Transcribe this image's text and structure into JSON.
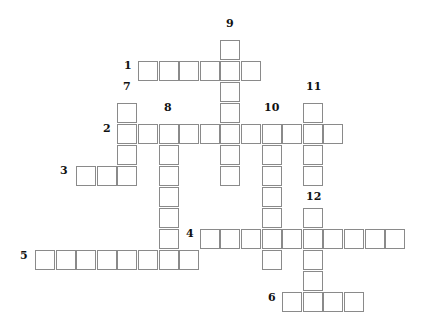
{
  "puzzle": {
    "type": "crossword",
    "grid_origin": {
      "x": 35,
      "y": 40
    },
    "cell_pitch": {
      "x": 20.6,
      "y": 21
    },
    "words": [
      {
        "number": "1",
        "direction": "across",
        "row": 1,
        "col": 5,
        "length": 6,
        "label_pos": {
          "x": 124,
          "y": 65
        }
      },
      {
        "number": "2",
        "direction": "across",
        "row": 4,
        "col": 4,
        "length": 11,
        "label_pos": {
          "x": 103,
          "y": 128
        }
      },
      {
        "number": "3",
        "direction": "across",
        "row": 6,
        "col": 2,
        "length": 3,
        "label_pos": {
          "x": 60,
          "y": 170
        }
      },
      {
        "number": "4",
        "direction": "across",
        "row": 9,
        "col": 8,
        "length": 10,
        "label_pos": {
          "x": 186,
          "y": 233
        }
      },
      {
        "number": "5",
        "direction": "across",
        "row": 10,
        "col": 0,
        "length": 8,
        "label_pos": {
          "x": 20,
          "y": 255
        }
      },
      {
        "number": "6",
        "direction": "across",
        "row": 12,
        "col": 12,
        "length": 4,
        "label_pos": {
          "x": 268,
          "y": 297
        }
      },
      {
        "number": "7",
        "direction": "down",
        "row": 3,
        "col": 4,
        "length": 4,
        "label_pos": {
          "x": 123,
          "y": 86
        }
      },
      {
        "number": "8",
        "direction": "down",
        "row": 4,
        "col": 6,
        "length": 7,
        "label_pos": {
          "x": 164,
          "y": 107
        }
      },
      {
        "number": "9",
        "direction": "down",
        "row": 0,
        "col": 9,
        "length": 7,
        "label_pos": {
          "x": 226,
          "y": 23
        }
      },
      {
        "number": "10",
        "direction": "down",
        "row": 4,
        "col": 11,
        "length": 7,
        "label_pos": {
          "x": 264,
          "y": 107
        }
      },
      {
        "number": "11",
        "direction": "down",
        "row": 3,
        "col": 13,
        "length": 4,
        "label_pos": {
          "x": 306,
          "y": 86
        }
      },
      {
        "number": "12",
        "direction": "down",
        "row": 8,
        "col": 13,
        "length": 5,
        "label_pos": {
          "x": 306,
          "y": 196
        }
      }
    ]
  }
}
